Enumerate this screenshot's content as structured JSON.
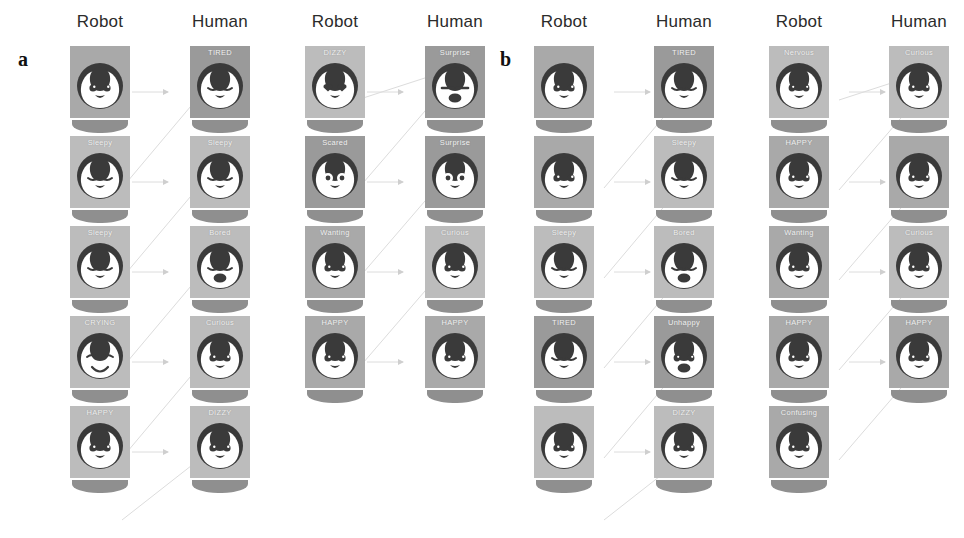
{
  "figure": {
    "width": 964,
    "height": 538,
    "background": "#ffffff",
    "panel_letters": {
      "a": "a",
      "b": "b"
    },
    "column_header_robot": "Robot",
    "column_header_human": "Human",
    "colors": {
      "card_light": "#bcbcbc",
      "card_mid": "#a9a9a9",
      "card_dark": "#9a9a9a",
      "body_bar": "#8f8f8f",
      "face_dark": "#3a3a3a",
      "face_light": "#ffffff",
      "label_text": "#f2f2f2",
      "header_text": "#2b2b2b",
      "arrow": "#d8d8d8"
    }
  },
  "panels": [
    {
      "id": "a",
      "letter": "a",
      "column_groups": [
        {
          "id": "a-g1",
          "left": 40,
          "robot_header": "Robot",
          "human_header": "Human",
          "rows": [
            {
              "robot": {
                "label": "",
                "expression": "neutral",
                "shade": "mid"
              },
              "human": {
                "label": "TIRED",
                "expression": "tired",
                "shade": "dark"
              }
            },
            {
              "robot": {
                "label": "Sleepy",
                "expression": "sleepy",
                "shade": "light"
              },
              "human": {
                "label": "Sleepy",
                "expression": "sleepy",
                "shade": "light"
              }
            },
            {
              "robot": {
                "label": "Sleepy",
                "expression": "sleepy",
                "shade": "light"
              },
              "human": {
                "label": "Bored",
                "expression": "bored",
                "shade": "light"
              }
            },
            {
              "robot": {
                "label": "CRYING",
                "expression": "crying",
                "shade": "light"
              },
              "human": {
                "label": "Curious",
                "expression": "curious",
                "shade": "light"
              }
            },
            {
              "robot": {
                "label": "HAPPY",
                "expression": "happy",
                "shade": "light"
              },
              "human": {
                "label": "DIZZY",
                "expression": "dizzy",
                "shade": "light"
              }
            }
          ]
        },
        {
          "id": "a-g2",
          "left": 275,
          "robot_header": "Robot",
          "human_header": "Human",
          "rows": [
            {
              "robot": {
                "label": "DIZZY",
                "expression": "dizzy-heart",
                "shade": "light"
              },
              "human": {
                "label": "Surprise",
                "expression": "surprise",
                "shade": "dark"
              }
            },
            {
              "robot": {
                "label": "Scared",
                "expression": "scared",
                "shade": "dark"
              },
              "human": {
                "label": "Surprise",
                "expression": "surprise2",
                "shade": "dark"
              }
            },
            {
              "robot": {
                "label": "Wanting",
                "expression": "wanting",
                "shade": "mid"
              },
              "human": {
                "label": "Curious",
                "expression": "curious",
                "shade": "light"
              }
            },
            {
              "robot": {
                "label": "HAPPY",
                "expression": "happy",
                "shade": "mid"
              },
              "human": {
                "label": "HAPPY",
                "expression": "happy",
                "shade": "mid"
              }
            },
            {
              "robot": {
                "label": "",
                "expression": "",
                "shade": "",
                "empty": true
              },
              "human": {
                "label": "",
                "expression": "",
                "shade": "",
                "empty": true
              }
            }
          ]
        }
      ]
    },
    {
      "id": "b",
      "letter": "b",
      "column_groups": [
        {
          "id": "b-g1",
          "left": 22,
          "robot_header": "Robot",
          "human_header": "Human",
          "rows": [
            {
              "robot": {
                "label": "",
                "expression": "neutral",
                "shade": "mid"
              },
              "human": {
                "label": "TIRED",
                "expression": "tired",
                "shade": "dark"
              }
            },
            {
              "robot": {
                "label": "",
                "expression": "neutral",
                "shade": "mid"
              },
              "human": {
                "label": "Sleepy",
                "expression": "sleepy",
                "shade": "light"
              }
            },
            {
              "robot": {
                "label": "Sleepy",
                "expression": "sleepy",
                "shade": "light"
              },
              "human": {
                "label": "Bored",
                "expression": "bored",
                "shade": "light"
              }
            },
            {
              "robot": {
                "label": "TIRED",
                "expression": "tired",
                "shade": "dark"
              },
              "human": {
                "label": "Unhappy",
                "expression": "unhappy",
                "shade": "dark"
              }
            },
            {
              "robot": {
                "label": "",
                "expression": "neutral",
                "shade": "light"
              },
              "human": {
                "label": "DIZZY",
                "expression": "dizzy",
                "shade": "light"
              }
            }
          ]
        },
        {
          "id": "b-g2",
          "left": 257,
          "robot_header": "Robot",
          "human_header": "Human",
          "rows": [
            {
              "robot": {
                "label": "Nervous",
                "expression": "nervous",
                "shade": "light"
              },
              "human": {
                "label": "Curious",
                "expression": "curious",
                "shade": "light"
              }
            },
            {
              "robot": {
                "label": "HAPPY",
                "expression": "happy",
                "shade": "mid"
              },
              "human": {
                "label": "",
                "expression": "neutral",
                "shade": "mid"
              }
            },
            {
              "robot": {
                "label": "Wanting",
                "expression": "wanting",
                "shade": "mid"
              },
              "human": {
                "label": "Curious",
                "expression": "curious",
                "shade": "light"
              }
            },
            {
              "robot": {
                "label": "HAPPY",
                "expression": "happy",
                "shade": "mid"
              },
              "human": {
                "label": "HAPPY",
                "expression": "happy",
                "shade": "mid"
              }
            },
            {
              "robot": {
                "label": "Confusing",
                "expression": "confusing",
                "shade": "mid"
              },
              "human": {
                "label": "",
                "expression": "",
                "shade": "",
                "empty": true
              }
            }
          ]
        }
      ]
    }
  ]
}
